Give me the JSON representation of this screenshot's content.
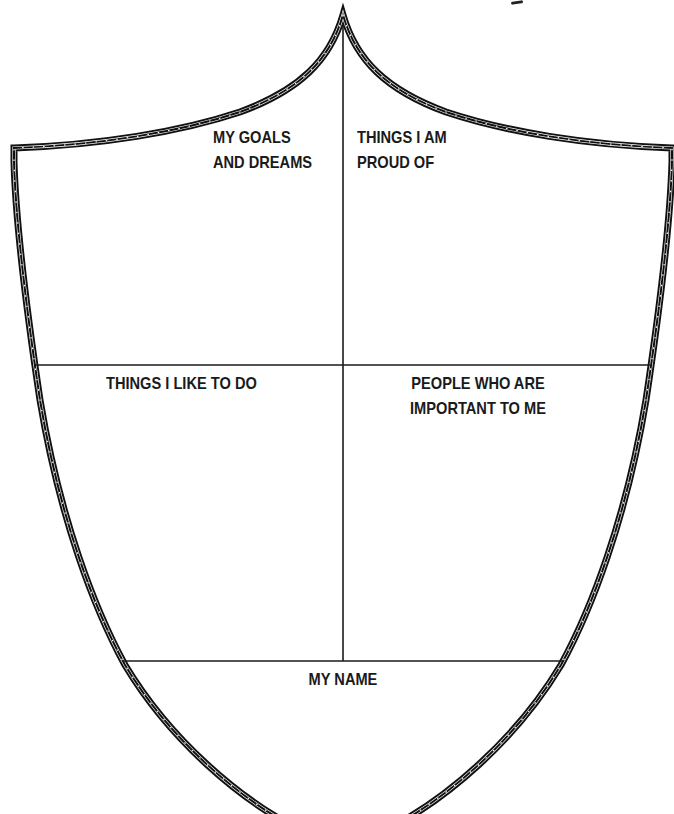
{
  "worksheet": {
    "type": "shield",
    "colors": {
      "border": "#111111",
      "border_dots": "#ffffff",
      "divider": "#1a1a1a",
      "text": "#1a1a1a",
      "background": "#ffffff"
    },
    "sections": {
      "goals": {
        "lines": [
          "MY GOALS",
          "AND DREAMS"
        ]
      },
      "proud": {
        "lines": [
          "THINGS I AM",
          "PROUD OF"
        ]
      },
      "like": {
        "lines": [
          "THINGS I LIKE TO DO"
        ]
      },
      "people": {
        "lines": [
          "PEOPLE WHO ARE",
          "IMPORTANT TO ME"
        ]
      },
      "name": {
        "lines": [
          "MY NAME"
        ]
      }
    }
  }
}
